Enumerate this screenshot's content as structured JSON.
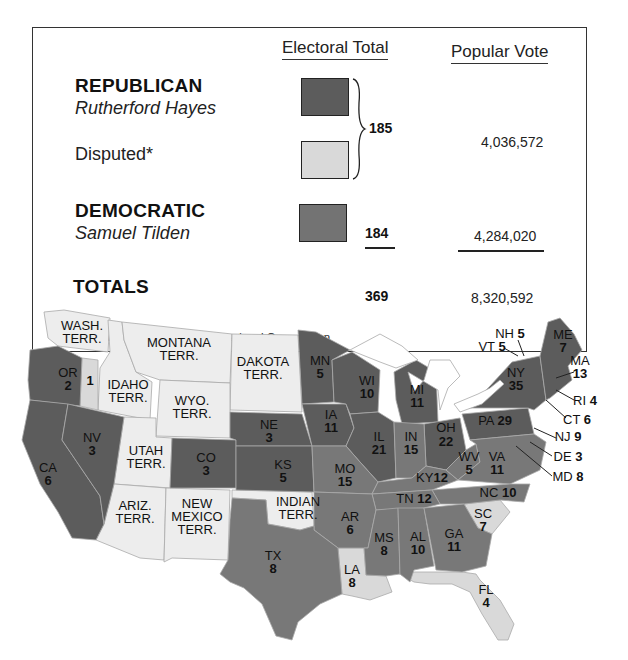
{
  "legend": {
    "headers": {
      "electoral": "Electoral Total",
      "popular": "Popular Vote"
    },
    "rows": [
      {
        "party": "REPUBLICAN",
        "candidate": "Rutherford Hayes",
        "swatch_color": "#5c5c5c"
      },
      {
        "label": "Disputed*",
        "swatch_color": "#d9d9d9"
      },
      {
        "party": "DEMOCRATIC",
        "candidate": "Samuel Tilden",
        "swatch_color": "#737373"
      }
    ],
    "hayes_electoral": "185",
    "hayes_popular": "4,036,572",
    "tilden_electoral": "184",
    "tilden_popular": "4,284,020",
    "totals_label": "TOTALS",
    "totals_electoral": "369",
    "totals_popular": "8,320,592",
    "footnote_mark": "*",
    "footnote": "Assigned to Hayes by Congressional Commission"
  },
  "colors": {
    "republican": "#5c5c5c",
    "democratic": "#787878",
    "disputed": "#d9d9d9",
    "territory": "#ededed",
    "border": "#bbbbbb",
    "water": "#ffffff"
  },
  "map": {
    "labels": [
      {
        "name": "WASH.",
        "sub": "TERR.",
        "x": 82,
        "y": 330
      },
      {
        "name": "MONTANA",
        "sub": "TERR.",
        "x": 179,
        "y": 347
      },
      {
        "name": "DAKOTA",
        "sub": "TERR.",
        "x": 263,
        "y": 366
      },
      {
        "name": "OR",
        "sub": "2",
        "x": 68,
        "y": 377
      },
      {
        "name": "",
        "sub": "1",
        "x": 90,
        "y": 382
      },
      {
        "name": "IDAHO",
        "sub": "TERR.",
        "x": 128,
        "y": 389
      },
      {
        "name": "WYO.",
        "sub": "TERR.",
        "x": 192,
        "y": 405
      },
      {
        "name": "NV",
        "sub": "3",
        "x": 92,
        "y": 438
      },
      {
        "name": "UTAH",
        "sub": "TERR.",
        "x": 146,
        "y": 455
      },
      {
        "name": "CO",
        "sub": "3",
        "x": 206,
        "y": 460
      },
      {
        "name": "CA",
        "sub": "6",
        "x": 50,
        "y": 468
      },
      {
        "name": "NE",
        "sub": "3",
        "x": 269,
        "y": 427
      },
      {
        "name": "KS",
        "sub": "5",
        "x": 283,
        "y": 468
      },
      {
        "name": "MN",
        "sub": "5",
        "x": 320,
        "y": 363
      },
      {
        "name": "WI",
        "sub": "10",
        "x": 367,
        "y": 383
      },
      {
        "name": "MI",
        "sub": "11",
        "x": 417,
        "y": 392
      },
      {
        "name": "IA",
        "sub": "11",
        "x": 331,
        "y": 419
      },
      {
        "name": "IL",
        "sub": "21",
        "x": 379,
        "y": 441
      },
      {
        "name": "IN",
        "sub": "15",
        "x": 411,
        "y": 441
      },
      {
        "name": "OH",
        "sub": "22",
        "x": 446,
        "y": 432
      },
      {
        "name": "MO",
        "sub": "15",
        "x": 345,
        "y": 472
      },
      {
        "name": "ARIZ.",
        "sub": "TERR.",
        "x": 135,
        "y": 509
      },
      {
        "name": "NEW",
        "sub": "MEXICO",
        "sub2": "TERR.",
        "x": 197,
        "y": 509
      },
      {
        "name": "INDIAN",
        "sub": "TERR.",
        "x": 295,
        "y": 505
      },
      {
        "name": "AR",
        "sub": "6",
        "x": 350,
        "y": 520
      },
      {
        "name": "TX",
        "sub": "8",
        "x": 273,
        "y": 560
      },
      {
        "name": "LA",
        "sub": "8",
        "x": 352,
        "y": 572
      },
      {
        "name": "MS",
        "sub": "8",
        "x": 384,
        "y": 541
      },
      {
        "name": "AL",
        "sub": "10",
        "x": 418,
        "y": 540
      },
      {
        "name": "GA",
        "sub": "11",
        "x": 454,
        "y": 536
      },
      {
        "name": "SC",
        "sub": "7",
        "x": 483,
        "y": 517
      },
      {
        "name": "FL",
        "sub": "4",
        "x": 486,
        "y": 593
      },
      {
        "name": "WV",
        "sub": "5",
        "x": 469,
        "y": 460
      },
      {
        "name": "VA",
        "sub": "11",
        "x": 497,
        "y": 460
      }
    ],
    "inline_labels": [
      {
        "text": "KY",
        "num": "12",
        "x": 432,
        "y": 481
      },
      {
        "text": "TN",
        "num": "12",
        "x": 414,
        "y": 500
      },
      {
        "text": "NC",
        "num": "10",
        "x": 498,
        "y": 496
      },
      {
        "text": "PA",
        "num": "29",
        "x": 495,
        "y": 424
      }
    ],
    "callouts": [
      {
        "text": "NH",
        "num": "5",
        "x": 510,
        "y": 333
      },
      {
        "text": "VT",
        "num": "5",
        "x": 492,
        "y": 348
      },
      {
        "text": "ME",
        "sub": "7",
        "x": 563,
        "y": 339
      },
      {
        "text": "MA",
        "num": "13",
        "x": 578,
        "y": 370
      },
      {
        "text": "NY",
        "sub": "35",
        "x": 516,
        "y": 378
      },
      {
        "text": "RI",
        "num": "4",
        "x": 585,
        "y": 405
      },
      {
        "text": "CT",
        "num": "6",
        "x": 577,
        "y": 424
      },
      {
        "text": "NJ",
        "num": "9",
        "x": 560,
        "y": 441
      },
      {
        "text": "DE",
        "num": "3",
        "x": 560,
        "y": 460
      },
      {
        "text": "MD",
        "num": "8",
        "x": 560,
        "y": 481
      }
    ]
  }
}
